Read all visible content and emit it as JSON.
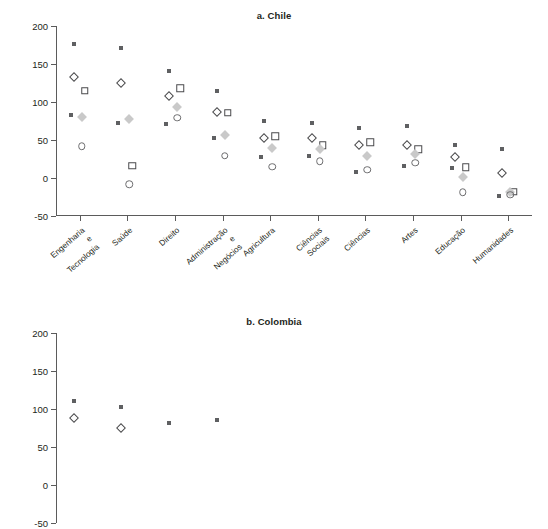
{
  "figure": {
    "panels": [
      {
        "key": "chile",
        "title": "a. Chile"
      },
      {
        "key": "colombia",
        "title": "b. Colombia"
      }
    ]
  },
  "chart_data": {
    "type": "scatter",
    "title": "a. Chile",
    "subtitle": "b. Colombia",
    "xlabel": "",
    "ylabel": "",
    "ylim": [
      -50,
      200
    ],
    "yticks": [
      200,
      150,
      100,
      50,
      0,
      -50
    ],
    "ytick_labels": [
      "200",
      "150",
      "100",
      "50",
      "0",
      "-50"
    ],
    "grid": false,
    "legend": "none",
    "categories": [
      "Engenharia e\nTecnologia",
      "Saúde",
      "Direito",
      "Administração e\nNegócios",
      "Agricultura",
      "Ciências Sociais",
      "Ciências",
      "Artes",
      "Educação",
      "Humanidades"
    ],
    "series": [
      {
        "name": "dark-small-square",
        "marker": "m-dot",
        "color": "#5f6062",
        "panel": "chile",
        "values": [
          176,
          171,
          141,
          114,
          75,
          72,
          66,
          69,
          43,
          38
        ]
      },
      {
        "name": "open-diamond",
        "marker": "m-odiamond",
        "color": "#4a4a4c",
        "panel": "chile",
        "values": [
          133,
          125,
          108,
          87,
          53,
          52,
          43,
          43,
          28,
          6
        ]
      },
      {
        "name": "open-square",
        "marker": "m-osquare",
        "color": "#4a4a4c",
        "panel": "chile",
        "values": [
          115,
          16,
          118,
          86,
          55,
          43,
          47,
          38,
          14,
          -18
        ]
      },
      {
        "name": "gray-diamond",
        "marker": "m-gdiamond",
        "color": "#c9c9c9",
        "panel": "chile",
        "values": [
          80,
          77,
          93,
          57,
          40,
          38,
          29,
          31,
          1,
          -19
        ]
      },
      {
        "name": "open-circle",
        "marker": "m-ocircle",
        "color": "#6d6d6f",
        "panel": "chile",
        "values": [
          42,
          -8,
          79,
          29,
          15,
          22,
          11,
          20,
          -19,
          -22
        ]
      },
      {
        "name": "dark-small-square-low",
        "marker": "m-dot",
        "color": "#5f6062",
        "panel": "chile",
        "values": [
          83,
          72,
          71,
          53,
          27,
          29,
          8,
          16,
          13,
          -24
        ]
      },
      {
        "name": "dark-small-square",
        "marker": "m-dot",
        "color": "#5f6062",
        "panel": "colombia",
        "values": [
          111,
          102,
          82,
          85,
          null,
          null,
          null,
          null,
          null,
          null
        ]
      },
      {
        "name": "open-diamond",
        "marker": "m-odiamond",
        "color": "#4a4a4c",
        "panel": "colombia",
        "values": [
          88,
          75,
          null,
          null,
          null,
          null,
          null,
          null,
          null,
          null
        ]
      }
    ]
  }
}
